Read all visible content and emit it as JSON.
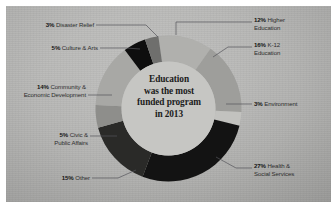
{
  "chart_data": {
    "type": "pie",
    "variant": "donut",
    "title": "Education was the most funded program in 2013",
    "center_text_lines": [
      "Education",
      "was the most",
      "funded program",
      "in 2013"
    ],
    "unit": "%",
    "total": 100,
    "categories": [
      "Higher Education",
      "K-12 Education",
      "Environment",
      "Health & Social Services",
      "Other",
      "Civic & Public Affairs",
      "Community & Economic Development",
      "Culture & Arts",
      "Disaster Relief"
    ],
    "values": [
      12,
      16,
      3,
      27,
      15,
      5,
      14,
      5,
      3
    ],
    "colors": [
      "#b0b0ad",
      "#9e9e9b",
      "#c2c2bf",
      "#131313",
      "#2a2a28",
      "#8e8e8b",
      "#a8a8a5",
      "#0e0e0e",
      "#6f6f6d"
    ],
    "legend": "callout-labels",
    "grid": false
  },
  "labels": {
    "disaster_relief": {
      "pct": "3%",
      "name": "Disaster Relief"
    },
    "culture_arts": {
      "pct": "5%",
      "name": "Culture & Arts"
    },
    "community_econ": {
      "pct": "14%",
      "name_line1": "Community &",
      "name_line2": "Economic Development"
    },
    "civic_public": {
      "pct": "5%",
      "name_line1": "Civic &",
      "name_line2": "Public Affairs"
    },
    "other": {
      "pct": "15%",
      "name": "Other"
    },
    "higher_education": {
      "pct": "12%",
      "name_line1": "Higher",
      "name_line2": "Education"
    },
    "k12_education": {
      "pct": "16%",
      "name_line1": "K-12",
      "name_line2": "Education"
    },
    "environment": {
      "pct": "3%",
      "name": "Environment"
    },
    "health_social": {
      "pct": "27%",
      "name_line1": "Health &",
      "name_line2": "Social Services"
    }
  },
  "center": {
    "line1": "Education",
    "line2": "was the most",
    "line3": "funded program",
    "line4": "in 2013"
  }
}
